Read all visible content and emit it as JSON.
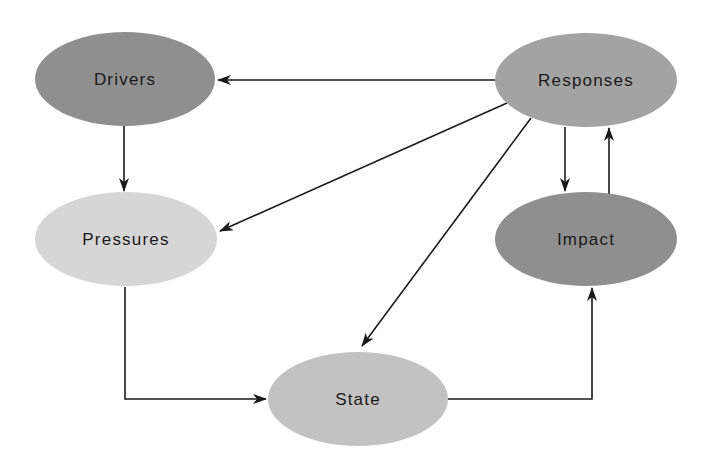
{
  "diagram": {
    "type": "flow",
    "nodes": [
      {
        "id": "drivers",
        "label": "Drivers",
        "cx": 125,
        "cy": 79,
        "rx": 90,
        "ry": 47,
        "fill": "#8f8f8f"
      },
      {
        "id": "responses",
        "label": "Responses",
        "cx": 586,
        "cy": 80,
        "rx": 91,
        "ry": 47,
        "fill": "#a3a3a3"
      },
      {
        "id": "pressures",
        "label": "Pressures",
        "cx": 126,
        "cy": 239,
        "rx": 91,
        "ry": 47,
        "fill": "#d6d6d6"
      },
      {
        "id": "impact",
        "label": "Impact",
        "cx": 586,
        "cy": 239,
        "rx": 91,
        "ry": 47,
        "fill": "#8f8f8f"
      },
      {
        "id": "state",
        "label": "State",
        "cx": 358,
        "cy": 399,
        "rx": 90,
        "ry": 47,
        "fill": "#c2c2c2"
      }
    ],
    "edges": [
      {
        "from": "responses",
        "to": "drivers"
      },
      {
        "from": "drivers",
        "to": "pressures"
      },
      {
        "from": "responses",
        "to": "pressures"
      },
      {
        "from": "responses",
        "to": "state"
      },
      {
        "from": "responses",
        "to": "impact"
      },
      {
        "from": "impact",
        "to": "responses"
      },
      {
        "from": "pressures",
        "to": "state"
      },
      {
        "from": "state",
        "to": "impact"
      }
    ]
  }
}
